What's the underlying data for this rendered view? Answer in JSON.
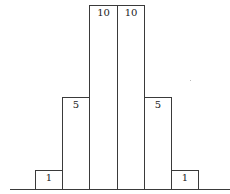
{
  "chart_data": {
    "type": "bar",
    "title": "",
    "xlabel": "",
    "ylabel": "",
    "categories": [
      "1",
      "2",
      "3",
      "4",
      "5",
      "6"
    ],
    "values": [
      1,
      5,
      10,
      10,
      5,
      1
    ],
    "data_labels": [
      "1",
      "5",
      "10",
      "10",
      "5",
      "1"
    ],
    "ylim": [
      0,
      10
    ],
    "grid": false,
    "legend": null,
    "bar_gap": 0,
    "colors": {
      "fill": "#ffffff",
      "stroke": "#3a3a3a",
      "text": "#222222"
    }
  }
}
